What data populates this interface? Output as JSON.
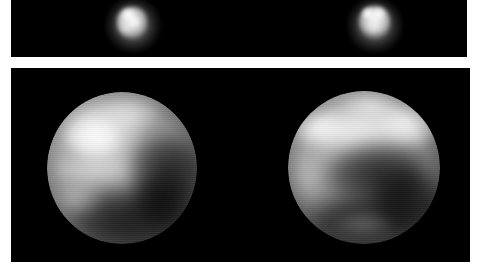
{
  "figure": {
    "background_color": "#ffffff",
    "width": 486,
    "height": 269,
    "panel_background": "#000000"
  },
  "panels": [
    {
      "id": "raw",
      "name": "raw-telescope-frames",
      "caption": "",
      "background_color": "#000000",
      "x": 11,
      "y": 0,
      "width": 456,
      "height": 57,
      "objects": [
        {
          "name": "pluto-raw-left",
          "label": "",
          "center_x": 122,
          "center_y": 25,
          "radius": 18,
          "peak_brightness": "#d8d8d8",
          "description": "unresolved blurred disk"
        },
        {
          "name": "pluto-raw-right",
          "label": "",
          "center_x": 364,
          "center_y": 25,
          "radius": 18,
          "peak_brightness": "#e2e2e2",
          "description": "unresolved blurred disk"
        }
      ]
    },
    {
      "id": "processed",
      "name": "processed-hemisphere-maps",
      "caption": "",
      "background_color": "#000000",
      "x": 11,
      "y": 68,
      "width": 459,
      "height": 194,
      "objects": [
        {
          "name": "pluto-globe-left",
          "label": "",
          "center_x": 122,
          "center_y": 168,
          "radius": 75,
          "peak_brightness": "#f2f2f2",
          "description": "bright north polar cap, dark equatorial band"
        },
        {
          "name": "pluto-globe-right",
          "label": "",
          "center_x": 364,
          "center_y": 168,
          "radius": 76,
          "peak_brightness": "#f5f5f5",
          "description": "bright northern band, dark southern region"
        }
      ]
    }
  ],
  "colors": {
    "page_background": "#ffffff",
    "sky": "#000000",
    "highlight": "#ffffff",
    "midtone": "#8a8a8a",
    "shadow": "#1a1a1a"
  }
}
